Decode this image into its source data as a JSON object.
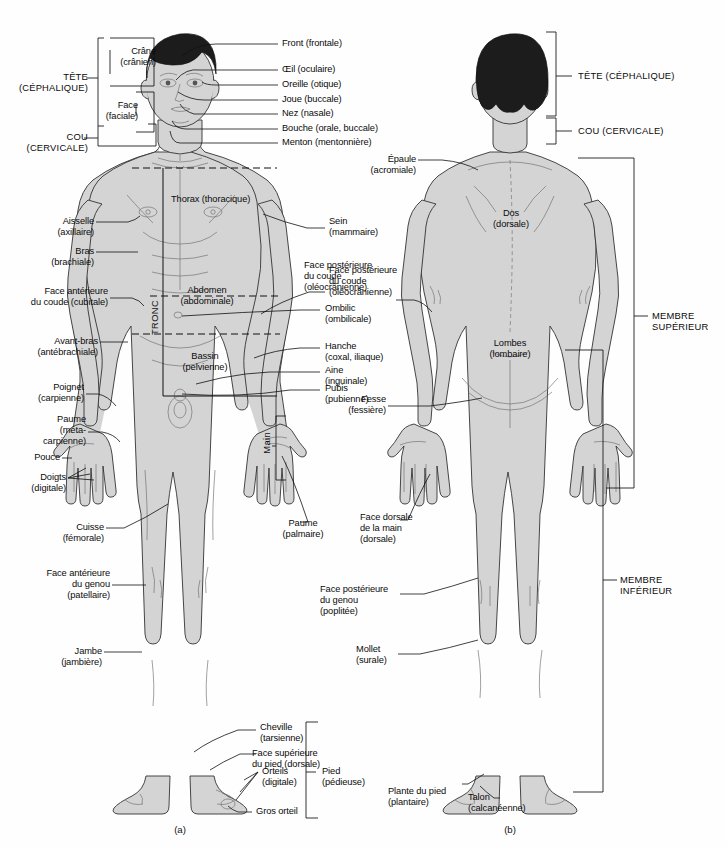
{
  "diagram": {
    "language": "fr",
    "captions": {
      "anterior": "(a)",
      "posterior": "(b)"
    }
  },
  "colors": {
    "skin": "#d4d4d4",
    "hair": "#1c1c1c",
    "outline": "#333333",
    "leader": "#111111",
    "background": "#fefefe"
  },
  "anterior": {
    "major_regions": [
      {
        "name": "tete",
        "label": "TÊTE\n(CÉPHALIQUE)"
      },
      {
        "name": "cou",
        "label": "COU\n(CERVICALE)"
      },
      {
        "name": "tronc",
        "label": "TRONC"
      }
    ],
    "head_subregions": [
      {
        "name": "crane",
        "label": "Crâne\n(crânien)"
      },
      {
        "name": "face",
        "label": "Face\n(faciale)"
      }
    ],
    "face_labels": [
      {
        "name": "front",
        "label": "Front (frontale)"
      },
      {
        "name": "oeil",
        "label": "Œil (oculaire)"
      },
      {
        "name": "oreille",
        "label": "Oreille (otique)"
      },
      {
        "name": "joue",
        "label": "Joue (buccale)"
      },
      {
        "name": "nez",
        "label": "Nez (nasale)"
      },
      {
        "name": "bouche",
        "label": "Bouche (orale, buccale)"
      },
      {
        "name": "menton",
        "label": "Menton (mentonnière)"
      }
    ],
    "left_labels": [
      {
        "name": "aisselle",
        "label": "Aisselle\n(axillaire)"
      },
      {
        "name": "bras",
        "label": "Bras\n(brachiale)"
      },
      {
        "name": "face-anterieure-coude",
        "label": "Face antérieure\ndu coude (cubitale)"
      },
      {
        "name": "avant-bras",
        "label": "Avant-bras\n(antébrachiale)"
      },
      {
        "name": "poignet",
        "label": "Poignet\n(carpienne)"
      },
      {
        "name": "paume",
        "label": "Paume\n(méta-\ncarpienne)"
      },
      {
        "name": "pouce",
        "label": "Pouce"
      },
      {
        "name": "doigts",
        "label": "Doigts\n(digitale)"
      },
      {
        "name": "cuisse",
        "label": "Cuisse\n(fémorale)"
      },
      {
        "name": "face-anterieure-genou",
        "label": "Face antérieure\ndu genou\n(patellaire)"
      },
      {
        "name": "jambe",
        "label": "Jambe\n(jambière)"
      }
    ],
    "trunk_labels": [
      {
        "name": "thorax",
        "label": "Thorax (thoracique)"
      },
      {
        "name": "abdomen",
        "label": "Abdomen\n(abdominale)"
      },
      {
        "name": "bassin",
        "label": "Bassin\n(pelvienne)"
      }
    ],
    "right_labels": [
      {
        "name": "sein",
        "label": "Sein\n(mammaire)"
      },
      {
        "name": "face-posterieure-coude",
        "label": "Face postérieure\ndu coude\n(oléocrânienne)"
      },
      {
        "name": "ombilic",
        "label": "Ombilic\n(ombilicale)"
      },
      {
        "name": "hanche",
        "label": "Hanche\n(coxal, iliaque)"
      },
      {
        "name": "aine",
        "label": "Aine\n(inguinale)"
      },
      {
        "name": "pubis",
        "label": "Pubis\n(pubienne)"
      },
      {
        "name": "paume-palmaire",
        "label": "Paume\n(palmaire)"
      }
    ],
    "hand_bracket_label": "Main",
    "foot_labels": [
      {
        "name": "cheville",
        "label": "Cheville\n(tarsienne)"
      },
      {
        "name": "face-superieure-pied",
        "label": "Face supérieure\ndu pied (dorsale)"
      },
      {
        "name": "orteils",
        "label": "Orteils\n(digitale)"
      },
      {
        "name": "gros-orteil",
        "label": "Gros orteil"
      },
      {
        "name": "pied",
        "label": "Pied\n(pédieuse)"
      }
    ]
  },
  "posterior": {
    "major_regions": [
      {
        "name": "tete-cephalique",
        "label": "TÊTE (CÉPHALIQUE)"
      },
      {
        "name": "cou-cervicale",
        "label": "COU (CERVICALE)"
      },
      {
        "name": "membre-superieur",
        "label": "MEMBRE\nSUPÉRIEUR"
      },
      {
        "name": "membre-inferieur",
        "label": "MEMBRE\nINFÉRIEUR"
      }
    ],
    "labels": [
      {
        "name": "epaule",
        "label": "Épaule\n(acromiale)"
      },
      {
        "name": "dos",
        "label": "Dos\n(dorsale)"
      },
      {
        "name": "lombes",
        "label": "Lombes\n(lombaire)"
      },
      {
        "name": "fesse",
        "label": "Fesse\n(fessière)"
      },
      {
        "name": "face-dorsale-main",
        "label": "Face dorsale\nde la main\n(dorsale)"
      },
      {
        "name": "face-posterieure-genou",
        "label": "Face postérieure\ndu genou\n(poplitée)"
      },
      {
        "name": "mollet",
        "label": "Mollet\n(surale)"
      },
      {
        "name": "plante-pied",
        "label": "Plante du pied\n(plantaire)"
      },
      {
        "name": "talon",
        "label": "Talon\n(calcanéenne)"
      }
    ]
  }
}
